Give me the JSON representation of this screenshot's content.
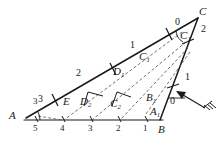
{
  "figure": {
    "stroke_color": "#1a1a1a",
    "dashed_color": "#555555",
    "vertices": {
      "A": "A",
      "B": "B",
      "C": "C",
      "E": "E"
    },
    "derived_points": {
      "A1": "A",
      "A1_sub": "1",
      "B1": "B",
      "B1_sub": "1",
      "C1_apex": "C",
      "C1_apex_sub": "1",
      "C1_mid": "C",
      "C1_mid_sub": "1",
      "C2": "C",
      "C2_sub": "2",
      "D1": "D",
      "D1_sub": "1",
      "D2": "D",
      "D2_sub": "2"
    },
    "segment_labels": {
      "ac_upper": "1",
      "ac_middle": "2",
      "ac_lower": "3",
      "bc_upper": "2",
      "bc_lower": "1",
      "angle_c_zero": "0",
      "angle_b_zero": "0"
    },
    "baseline_ticks": [
      "5",
      "4",
      "3",
      "2",
      "1"
    ],
    "baseline_start_label": "A",
    "baseline_end_label": "B",
    "vertex_A_above": "3",
    "vertex_A_below": "5",
    "arrow": {
      "name": "load-arrow",
      "hatch_marks": 3
    }
  }
}
